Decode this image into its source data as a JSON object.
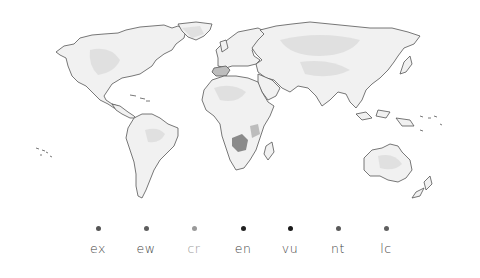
{
  "map": {
    "title": "World map (grayscale density)",
    "highlight_regions": [
      {
        "name": "southern-africa",
        "shade": "dark"
      },
      {
        "name": "east-africa",
        "shade": "mid"
      },
      {
        "name": "iberia",
        "shade": "mid"
      }
    ]
  },
  "legend": {
    "items": [
      {
        "label": "ex",
        "dot_color": "#555555",
        "label_color": "#444444",
        "x": 98
      },
      {
        "label": "ew",
        "dot_color": "#5e5e5e",
        "label_color": "#444444",
        "x": 146
      },
      {
        "label": "cr",
        "dot_color": "#9a9a9a",
        "label_color": "#9a9a9a",
        "x": 194
      },
      {
        "label": "en",
        "dot_color": "#222222",
        "label_color": "#444444",
        "x": 243
      },
      {
        "label": "vu",
        "dot_color": "#1a1a1a",
        "label_color": "#444444",
        "x": 290
      },
      {
        "label": "nt",
        "dot_color": "#5a5a5a",
        "label_color": "#444444",
        "x": 338
      },
      {
        "label": "lc",
        "dot_color": "#606060",
        "label_color": "#444444",
        "x": 386
      }
    ]
  }
}
